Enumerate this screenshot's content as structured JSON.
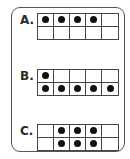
{
  "problems": [
    {
      "label": "A.",
      "rows": [
        [
          1,
          1,
          1,
          1,
          0
        ],
        [
          0,
          0,
          0,
          0,
          0
        ]
      ]
    },
    {
      "label": "B.",
      "rows": [
        [
          1,
          0,
          0,
          0,
          0
        ],
        [
          1,
          1,
          1,
          1,
          1
        ]
      ]
    },
    {
      "label": "C.",
      "rows": [
        [
          0,
          1,
          1,
          1,
          0
        ],
        [
          0,
          1,
          1,
          1,
          0
        ]
      ]
    }
  ],
  "colors": {
    "dot": "#111111",
    "line": "#444444"
  }
}
